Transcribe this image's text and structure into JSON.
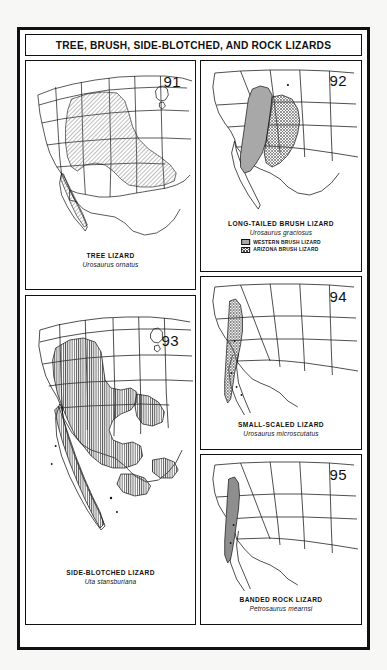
{
  "plate": {
    "title": "TREE, BRUSH, SIDE-BLOTCHED, AND ROCK LIZARDS"
  },
  "panels": [
    {
      "number": "91",
      "common_name": "TREE LIZARD",
      "scientific_name": "Urosaurus ornatus",
      "fill_style": "diagonal-hatch",
      "fill_color": "#6e6e6e",
      "region": "western United States and northern Mexico"
    },
    {
      "number": "92",
      "common_name": "LONG-TAILED BRUSH LIZARD",
      "scientific_name": "Urosaurus graciosus",
      "fill_style": "solid-and-crosshatch",
      "fill_color": "#a8a8a8",
      "region": "lower Colorado River basin",
      "legend": [
        {
          "swatch": "solid",
          "label": "WESTERN BRUSH LIZARD"
        },
        {
          "swatch": "crosshatch",
          "label": "ARIZONA BRUSH LIZARD"
        }
      ]
    },
    {
      "number": "93",
      "common_name": "SIDE-BLOTCHED LIZARD",
      "scientific_name": "Uta stansburiana",
      "fill_style": "vertical-hatch",
      "fill_color": "#555555",
      "region": "Great Basin, Southwest and Baja California"
    },
    {
      "number": "94",
      "common_name": "SMALL-SCALED LIZARD",
      "scientific_name": "Urosaurus microscutatus",
      "fill_style": "crosshatch",
      "fill_color": "#666666",
      "region": "northern Baja California"
    },
    {
      "number": "95",
      "common_name": "BANDED ROCK LIZARD",
      "scientific_name": "Petrosaurus mearnsi",
      "fill_style": "solid",
      "fill_color": "#8e8e8e",
      "region": "Peninsular Ranges and northeastern Baja California"
    }
  ]
}
